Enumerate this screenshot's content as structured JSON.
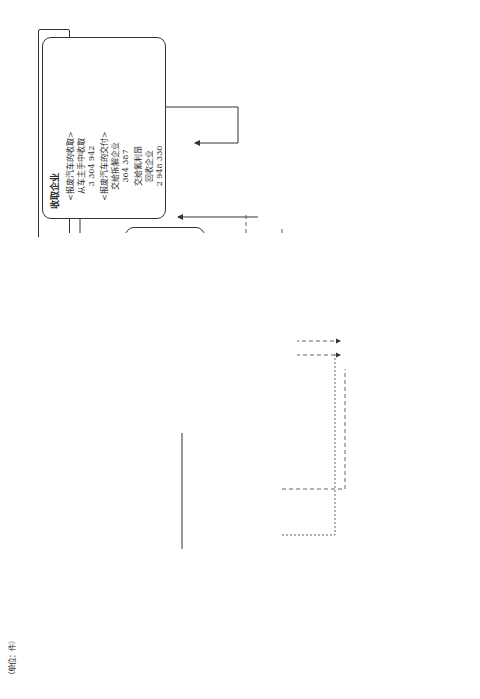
{
  "unit_label": "（单位：件）",
  "caption": "图 3-1　报废机动车的收取及交付情况（2017 年）",
  "owner": {
    "label": "汽车车主"
  },
  "collector": {
    "title": "收取企业",
    "receive": "<报废汽车的收取>\n从车主手中收取\n3 304 942",
    "deliver": "<报废汽车的交付>\n交给拆解企业\n364 387",
    "fluoro": "交给氟利昂\n回收企业\n2 948 330"
  },
  "fluoro_recovery": {
    "title": "氟利昂回收企业",
    "receive": "<报废汽车的收取>\n从收取企业\n2 945 744",
    "deliver": "<报废汽车的交付>\n交给拆解企业\n2 943 591"
  },
  "fluoro_delivery": {
    "text": "<氟利昂类的交付>\n交到指定收取地点\n3 030 045"
  },
  "dismantler": {
    "title": "拆解企业",
    "receive_collector": "<报废汽车的收取>\n从收取企业\n365 052",
    "receive_fluoro": "从氟利昂类回收企业\n2 952 176",
    "deliver_shredder": "<拆解后汽车的交付>\n交给破碎企业\n3 211 945",
    "to_certified": "交给认定全部利用者\n0",
    "to_uncertified": "交给非认定全部利用者\n93 372",
    "inner_box": "工序内\n交付给拆解企业\n130 632\n从拆解企业收取\n130 020",
    "airbag_delivery": "<气囊类的交付>\n交到指定收取地点\n打开　2 113 871\n打开/回收　109 647\n回收　431 075"
  },
  "shredder": {
    "title": "破碎企业",
    "receive": "<拆解后汽车的收取>\n从拆解企业\n3 207 758",
    "to_certified": "<拆解后汽车的交付>\n交给认定全部利用者\n167 465",
    "to_uncertified": "交给非认定全部利用者\n10 934",
    "inner_box": "工序内\n交给破碎企业\n2 691 399\n从破碎企业收取\n2 686 928",
    "asr_delivery": "<ASR 的交付>\n交到指定收取地点\n3 030 000"
  },
  "certified_user": {
    "label": "认定全部利用者"
  },
  "uncertified_user": {
    "label": "非认定全部\n利用者"
  },
  "tags": {
    "fluoro": "氟利\n昂类",
    "airbag": "气囊类",
    "asr": "ASR"
  },
  "manufacturer": {
    "fluoro_receive": "<氟利昂类的收取>\n从氟利昂类回收企业\n2 972 087",
    "airbag_receive": "<气囊类的收取>\n从拆解企业\n2 639 270",
    "asr_receive": "<ASR 的收取>\n从破碎企业\n2 980 817",
    "label": "汽车制造企业/进口企业（指定收取地点）"
  }
}
